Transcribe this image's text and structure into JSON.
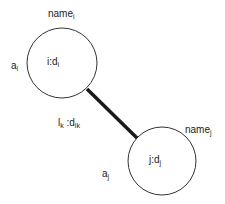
{
  "diagram": {
    "node_i": {
      "name_base": "name",
      "name_sub": "i",
      "attr_base": "a",
      "attr_sub": "i",
      "label_base": "i:d",
      "label_sub": "i"
    },
    "node_j": {
      "name_base": "name",
      "name_sub": "j",
      "attr_base": "a",
      "attr_sub": "j",
      "label_base": "j:d",
      "label_sub": "j"
    },
    "edge": {
      "label_l_base": "l",
      "label_l_sub": "k",
      "label_d_base": " :d",
      "label_d_sub": "ik"
    },
    "colors": {
      "stroke": "#333333",
      "edge": "#1a1a1a",
      "text": "#222222"
    }
  }
}
